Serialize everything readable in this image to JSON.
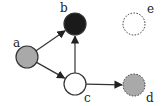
{
  "diagram": {
    "type": "directed-graph",
    "nodes": [
      {
        "id": "a",
        "label": "a",
        "cx": 27,
        "cy": 57,
        "r": 11,
        "fill": "#a9a9a9",
        "border": "solid",
        "label_x": 13,
        "label_y": 47
      },
      {
        "id": "b",
        "label": "b",
        "cx": 75,
        "cy": 24,
        "r": 11,
        "fill": "#1a1a1a",
        "border": "solid",
        "label_x": 60,
        "label_y": 12
      },
      {
        "id": "c",
        "label": "c",
        "cx": 75,
        "cy": 84,
        "r": 11,
        "fill": "#ffffff",
        "border": "solid",
        "label_x": 84,
        "label_y": 102
      },
      {
        "id": "d",
        "label": "d",
        "cx": 134,
        "cy": 85,
        "r": 11,
        "fill": "#a9a9a9",
        "border": "dashed",
        "label_x": 146,
        "label_y": 102
      },
      {
        "id": "e",
        "label": "e",
        "cx": 134,
        "cy": 24,
        "r": 11,
        "fill": "#ffffff",
        "border": "dashed",
        "label_x": 147,
        "label_y": 13
      }
    ],
    "edges": [
      {
        "from": "a",
        "to": "b"
      },
      {
        "from": "a",
        "to": "c"
      },
      {
        "from": "c",
        "to": "b"
      },
      {
        "from": "c",
        "to": "d"
      }
    ],
    "colors": {
      "edge": "#333333",
      "stroke": "#333333"
    }
  }
}
